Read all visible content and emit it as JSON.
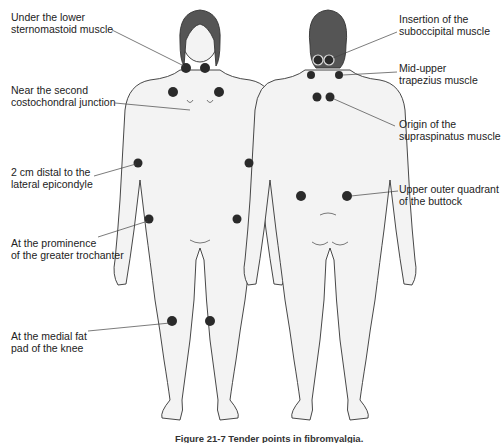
{
  "figure": {
    "caption": "Figure 21-7  Tender points in fibromyalgia.",
    "views": [
      "front",
      "back"
    ],
    "colors": {
      "skin": "#f3f3f3",
      "outline": "#333333",
      "hair": "#555555",
      "point": "#2a2a2a",
      "leader": "#444444"
    }
  },
  "labels_left": [
    {
      "line1": "Under the lower",
      "line2": "sternomastoid muscle"
    },
    {
      "line1": "Near the second",
      "line2": "costochondral junction"
    },
    {
      "line1": "2 cm distal to the",
      "line2": "lateral epicondyle"
    },
    {
      "line1": "At the prominence",
      "line2": "of the greater trochanter"
    },
    {
      "line1": "At the medial fat",
      "line2": "pad of the knee"
    }
  ],
  "labels_right": [
    {
      "line1": "Insertion of the",
      "line2": "suboccipital muscle"
    },
    {
      "line1": "Mid-upper",
      "line2": "trapezius muscle"
    },
    {
      "line1": "Origin of the",
      "line2": "supraspinatus muscle"
    },
    {
      "line1": "Upper outer quadrant",
      "line2": "of the buttock"
    }
  ]
}
